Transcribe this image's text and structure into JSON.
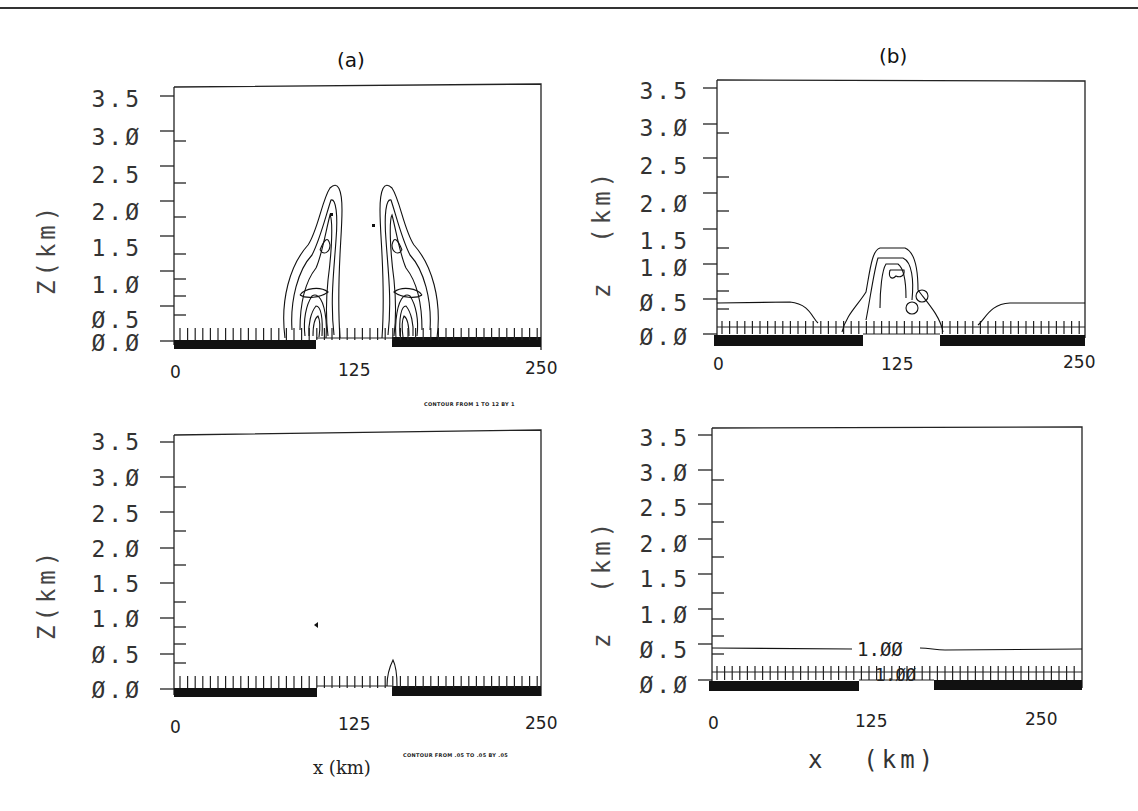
{
  "figure": {
    "panels": [
      {
        "id": "a",
        "label": "(a)"
      },
      {
        "id": "b",
        "label": "(b)"
      }
    ],
    "plots": [
      {
        "position": "top-left",
        "ylabel": "Z(km)",
        "yticks": [
          "3.5",
          "3.Ø",
          "2.5",
          "2.Ø",
          "1.5",
          "1.Ø",
          "Ø.5",
          "Ø.Ø"
        ],
        "xticks": [
          "0",
          "125",
          "250"
        ],
        "contour_note": "CONTOUR FROM 1 TO 12 BY 1"
      },
      {
        "position": "top-right",
        "ylabel": "z  (km)",
        "yticks": [
          "3.5",
          "3.Ø",
          "2.5",
          "2.Ø",
          "1.5",
          "1.Ø",
          "Ø.5",
          "Ø.Ø"
        ],
        "xticks": [
          "0",
          "125",
          "250"
        ]
      },
      {
        "position": "bottom-left",
        "ylabel": "Z(km)",
        "yticks": [
          "3.5",
          "3.Ø",
          "2.5",
          "2.Ø",
          "1.5",
          "1.Ø",
          "Ø.5",
          "Ø.Ø"
        ],
        "xticks": [
          "0",
          "125",
          "250"
        ],
        "xlabel": "x (km)",
        "contour_note": "CONTOUR FROM .05 TO .05 BY .05"
      },
      {
        "position": "bottom-right",
        "ylabel": "z  (km)",
        "yticks": [
          "3.5",
          "3.Ø",
          "2.5",
          "2.Ø",
          "1.5",
          "1.Ø",
          "Ø.5",
          "Ø.Ø"
        ],
        "xticks": [
          "0",
          "125",
          "250"
        ],
        "xlabel": "x  (km)",
        "contour_labels": [
          "1.ØØ",
          "1.ØØ"
        ]
      }
    ]
  },
  "chart_data": [
    {
      "type": "heatmap",
      "title": "(a) top",
      "xlabel": "x (km)",
      "ylabel": "Z (km)",
      "xlim": [
        0,
        250
      ],
      "ylim": [
        0,
        3.5
      ],
      "x_ticks": [
        0,
        125,
        250
      ],
      "y_ticks": [
        0.0,
        0.5,
        1.0,
        1.5,
        2.0,
        2.5,
        3.0,
        3.5
      ],
      "contour_levels": {
        "from": 1,
        "to": 12,
        "by": 1
      },
      "features": "Two symmetric plume-shaped contour clusters centered near x≈110 and x≈145 km, reaching ~2.2 km height; dense contours near surface (0–0.6 km)",
      "surface": "Land (thick bar) from 0–~95 km and ~150–250 km; gap (water) ~95–150 km"
    },
    {
      "type": "heatmap",
      "title": "(b) top",
      "xlabel": "x (km)",
      "ylabel": "z (km)",
      "xlim": [
        0,
        250
      ],
      "ylim": [
        0,
        3.5
      ],
      "x_ticks": [
        0,
        125,
        250
      ],
      "y_ticks": [
        0.0,
        0.5,
        1.0,
        1.5,
        2.0,
        2.5,
        3.0,
        3.5
      ],
      "features": "Boundary layer contour at ~0.45 km over land dropping near land-water edges; central dome of contours over x≈100–150 km reaching ~1.2 km"
    },
    {
      "type": "heatmap",
      "title": "(a) bottom",
      "xlabel": "x (km)",
      "ylabel": "Z (km)",
      "xlim": [
        0,
        250
      ],
      "ylim": [
        0,
        3.5
      ],
      "x_ticks": [
        0,
        125,
        250
      ],
      "y_ticks": [
        0.0,
        0.5,
        1.0,
        1.5,
        2.0,
        2.5,
        3.0,
        3.5
      ],
      "contour_levels": {
        "from": 0.05,
        "to": 0.05,
        "by": 0.05
      },
      "features": "Small contour bump near x≈150 km reaching ~0.4 km; small point near x≈95 km, z≈0.9 km"
    },
    {
      "type": "heatmap",
      "title": "(b) bottom",
      "xlabel": "x (km)",
      "ylabel": "z (km)",
      "xlim": [
        0,
        250
      ],
      "ylim": [
        0,
        3.5
      ],
      "x_ticks": [
        0,
        125,
        250
      ],
      "y_ticks": [
        0.0,
        0.5,
        1.0,
        1.5,
        2.0,
        2.5,
        3.0,
        3.5
      ],
      "contour_labels": [
        {
          "value": 1.0,
          "z_km": 0.47
        },
        {
          "value": 1.0,
          "z_km": 0.08
        }
      ],
      "features": "Nearly flat contour labeled 1.00 at ~0.47 km across domain; second 1.00 contour near surface"
    }
  ]
}
